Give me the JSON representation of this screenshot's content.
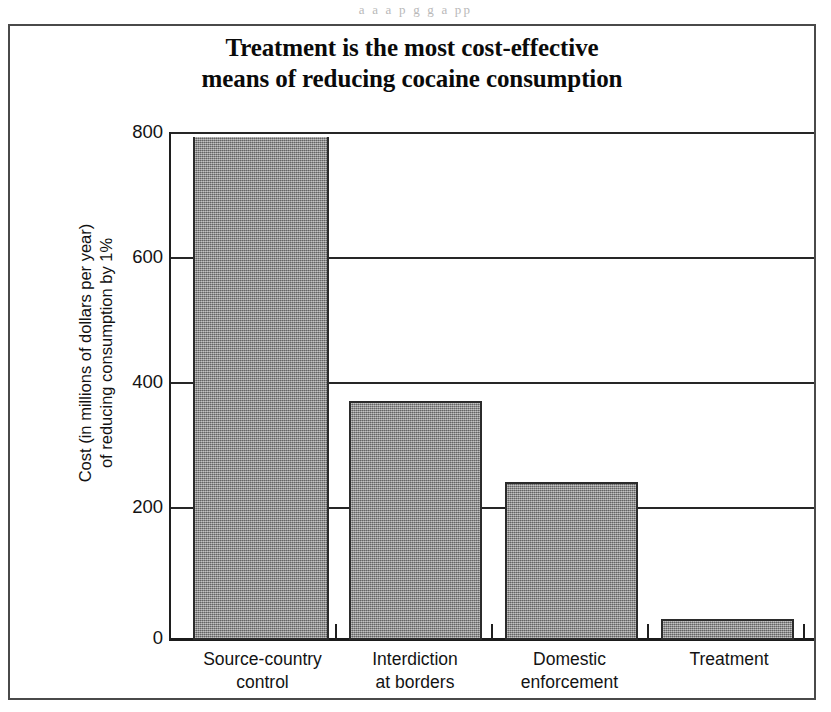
{
  "page": {
    "bleed_text": "a      a    a       p        g  g               a         pp"
  },
  "figure": {
    "title_line1": "Treatment is the most cost-effective",
    "title_line2": "means of reducing cocaine consumption",
    "y_axis_title_line1": "Cost (in millions of dollars per year)",
    "y_axis_title_line2": "of reducing consumption by 1%",
    "bar_fill_color": "#8a8a8a",
    "bar_edge_color": "#2b2b2b",
    "axis_color": "#1f1f1f",
    "background_color": "#ffffff"
  },
  "chart_data": {
    "type": "bar",
    "title": "Treatment is the most cost-effective means of reducing cocaine consumption",
    "xlabel": "",
    "ylabel": "Cost (in millions of dollars per year) of reducing consumption by 1%",
    "categories": [
      "Source-country control",
      "Interdiction at borders",
      "Domestic enforcement",
      "Treatment"
    ],
    "category_lines": [
      [
        "Source-country",
        "control"
      ],
      [
        "Interdiction",
        "at borders"
      ],
      [
        "Domestic",
        "enforcement"
      ],
      [
        "Treatment",
        ""
      ]
    ],
    "values": [
      805,
      383,
      253,
      34
    ],
    "value_notes": [
      "exceeds the plotted axis maximum; bar is clipped at the top of the plot area",
      "",
      "",
      ""
    ],
    "ylim": [
      0,
      805
    ],
    "yticks": [
      0,
      200,
      400,
      600,
      800
    ],
    "ytick_labels": [
      "0",
      "200",
      "400",
      "600",
      "800"
    ],
    "grid": "horizontal",
    "legend": "none",
    "units": "millions of dollars per year"
  }
}
